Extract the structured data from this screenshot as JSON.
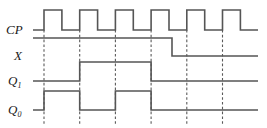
{
  "figure": {
    "type": "digital-timing-diagram",
    "title": "",
    "background_color": "#ffffff",
    "wave_color": "#555555",
    "gridline_color": "#5a5a5a",
    "label_color": "#1a1a1a"
  },
  "axis": {
    "x_start": 33,
    "x_end": 258,
    "clock_period_px": 35.7,
    "first_edge_x": 44,
    "edge_count": 6,
    "edge_positions": [
      44,
      79.7,
      115.4,
      151.1,
      186.8,
      222.5
    ]
  },
  "signals": [
    {
      "name": "CP",
      "label": "CP",
      "subscript": "",
      "label_x": 6,
      "label_y": 34,
      "baseline_y": 30,
      "high_y": 10,
      "description": "clock, 6 pulses, rising edge at each gridline, 50% duty",
      "initial_level": 0,
      "transitions": [
        {
          "x": 44,
          "to": 1
        },
        {
          "x": 61.9,
          "to": 0
        },
        {
          "x": 79.7,
          "to": 1
        },
        {
          "x": 97.6,
          "to": 0
        },
        {
          "x": 115.4,
          "to": 1
        },
        {
          "x": 133.3,
          "to": 0
        },
        {
          "x": 151.1,
          "to": 1
        },
        {
          "x": 169.0,
          "to": 0
        },
        {
          "x": 186.8,
          "to": 1
        },
        {
          "x": 204.7,
          "to": 0
        },
        {
          "x": 222.5,
          "to": 1
        },
        {
          "x": 240.4,
          "to": 0
        }
      ]
    },
    {
      "name": "X",
      "label": "X",
      "subscript": "",
      "label_x": 14,
      "label_y": 60,
      "baseline_y": 56,
      "high_y": 38,
      "description": "input X, high from start, falls to low after 4th clock edge",
      "initial_level": 1,
      "transitions": [
        {
          "x": 172,
          "to": 0
        }
      ]
    },
    {
      "name": "Q1",
      "label": "Q",
      "subscript": "1",
      "label_x": 8,
      "label_y": 85,
      "baseline_y": 81,
      "high_y": 62,
      "description": "flip-flop Q1 output, low, high between 2nd and 4th clock edge",
      "initial_level": 0,
      "transitions": [
        {
          "x": 79.7,
          "to": 1
        },
        {
          "x": 151.1,
          "to": 0
        }
      ]
    },
    {
      "name": "Q0",
      "label": "Q",
      "subscript": "0",
      "label_x": 8,
      "label_y": 114,
      "baseline_y": 110,
      "high_y": 91,
      "description": "flip-flop Q0 output, toggles on first four clock edges then stays low",
      "initial_level": 0,
      "transitions": [
        {
          "x": 44,
          "to": 1
        },
        {
          "x": 79.7,
          "to": 0
        },
        {
          "x": 115.4,
          "to": 1
        },
        {
          "x": 151.1,
          "to": 0
        }
      ]
    }
  ],
  "gridlines": {
    "y_top": 30,
    "y_bottom": 124,
    "x_positions": [
      44,
      79.7,
      115.4,
      151.1,
      186.8,
      222.5
    ]
  }
}
